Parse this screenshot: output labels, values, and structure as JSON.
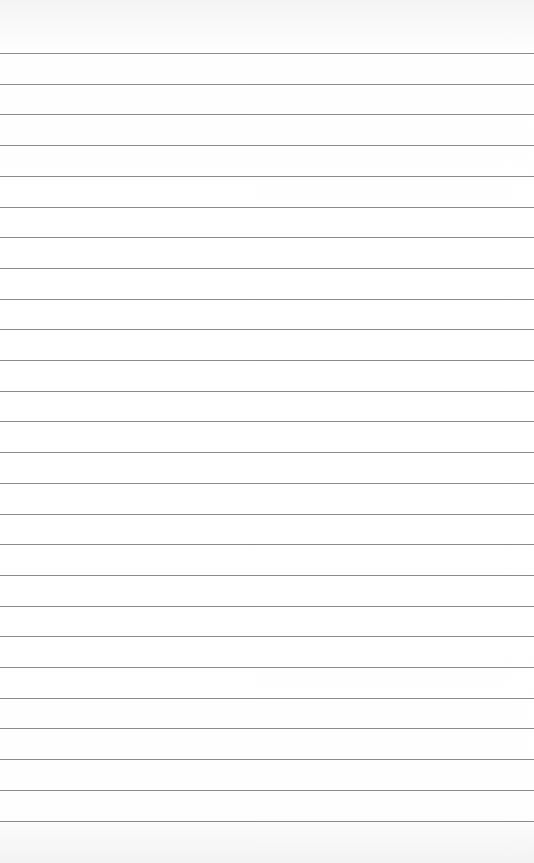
{
  "paper": {
    "type": "lined-paper",
    "line_color": "#8a8a8a",
    "background": "#ffffff",
    "first_line_y": 53,
    "line_spacing": 30.7,
    "line_count": 26
  }
}
